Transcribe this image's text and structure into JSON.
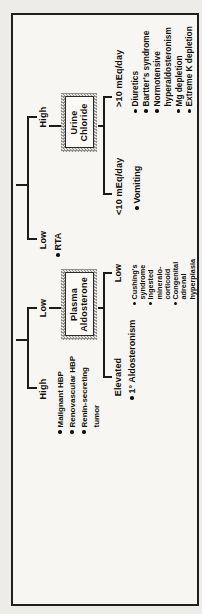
{
  "colors": {
    "line": "#1b1b1b",
    "text": "#101010",
    "frame_border": "#1f1f1f",
    "paper": "#f7f6f2",
    "box_hatch": "#8f8f8f"
  },
  "tree": {
    "left": {
      "high_label": "High",
      "high_items": [
        {
          "bullet": true,
          "text": "Malignant HBP"
        },
        {
          "bullet": true,
          "text": "Renovascular HBP"
        },
        {
          "bullet": true,
          "text": "Renin-secreting"
        },
        {
          "bullet": false,
          "text": "tumor"
        }
      ],
      "low_label": "Low",
      "box": {
        "line1": "Plasma",
        "line2": "Aldosterone"
      },
      "elevated_label": "Elevated",
      "elevated_items": [
        {
          "bullet": true,
          "text": "1° Aldosteronism"
        }
      ],
      "sub_low_label": "Low",
      "sub_low_items": [
        {
          "bullet": true,
          "text": "Cushing's"
        },
        {
          "bullet": false,
          "text": "syndrome"
        },
        {
          "bullet": true,
          "text": "Ingested"
        },
        {
          "bullet": false,
          "text": "mineralo-"
        },
        {
          "bullet": false,
          "text": "corticoid"
        },
        {
          "bullet": true,
          "text": "Congenital"
        },
        {
          "bullet": false,
          "text": "adrenal"
        },
        {
          "bullet": false,
          "text": "hyperplasia"
        }
      ]
    },
    "right": {
      "low_label": "Low",
      "low_items": [
        {
          "bullet": true,
          "text": "RTA"
        }
      ],
      "high_label": "High",
      "box": {
        "line1": "Urine",
        "line2": "Chloride"
      },
      "lt10_label": "<10 mEq/day",
      "lt10_items": [
        {
          "bullet": true,
          "text": "Vomiting"
        }
      ],
      "gt10_label": ">10 mEq/day",
      "gt10_items": [
        {
          "bullet": true,
          "text": "Diuretics"
        },
        {
          "bullet": true,
          "text": "Bartter's syndrome"
        },
        {
          "bullet": true,
          "text": "Normotensive"
        },
        {
          "bullet": false,
          "text": "hyperaldosteronism"
        },
        {
          "bullet": true,
          "text": "Mg depletion"
        },
        {
          "bullet": true,
          "text": "Extreme K depletion"
        }
      ]
    }
  }
}
